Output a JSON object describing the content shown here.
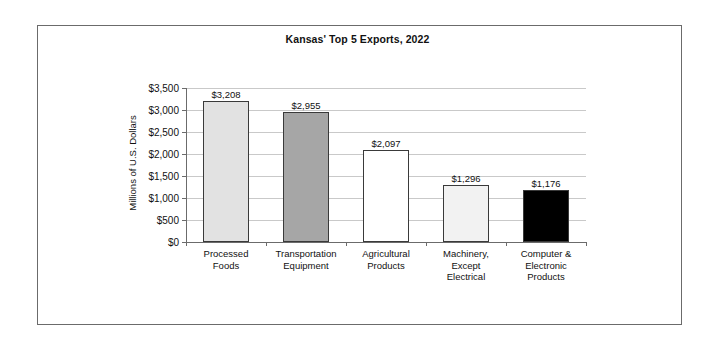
{
  "figure": {
    "frame_border_color": "#6b6b6b",
    "background": "#ffffff"
  },
  "chart_data": {
    "type": "bar",
    "title": "Kansas' Top 5 Exports, 2022",
    "xlabel": "",
    "ylabel": "Millions of U.S. Dollars",
    "categories": [
      "Processed Foods",
      "Transportation Equipment",
      "Agricultural Products",
      "Machinery, Except Electrical",
      "Computer & Electronic Products"
    ],
    "category_lines": [
      [
        "Processed",
        "Foods"
      ],
      [
        "Transportation",
        "Equipment"
      ],
      [
        "Agricultural",
        "Products"
      ],
      [
        "Machinery,",
        "Except",
        "Electrical"
      ],
      [
        "Computer &",
        "Electronic",
        "Products"
      ]
    ],
    "values": [
      3208,
      2955,
      2097,
      1296,
      1176
    ],
    "value_labels": [
      "$3,208",
      "$2,955",
      "$2,097",
      "$1,296",
      "$1,176"
    ],
    "bar_colors": [
      "#e2e2e2",
      "#a6a6a6",
      "#ffffff",
      "#f2f2f2",
      "#000000"
    ],
    "bar_edge_color": "#3a3a3a",
    "ylim": [
      0,
      3500
    ],
    "ytick_values": [
      0,
      500,
      1000,
      1500,
      2000,
      2500,
      3000,
      3500
    ],
    "ytick_labels": [
      "$0",
      "$500",
      "$1,000",
      "$1,500",
      "$2,000",
      "$2,500",
      "$3,000",
      "$3,500"
    ],
    "grid": true,
    "grid_color": "#c9c9c9",
    "legend": false,
    "legend_position": "none"
  }
}
